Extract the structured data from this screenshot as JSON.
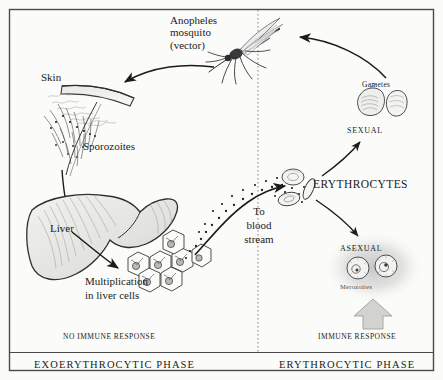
{
  "figure": {
    "title_semantic": "malaria-life-cycle-diagram",
    "frame_color": "#4a4a4a",
    "ink_color": "#1b1b1b",
    "halo_color": "#c9c9c9",
    "arrow_block_color": "#cfcfcf",
    "divider_style": "dotted"
  },
  "labels": {
    "mosquito": "Anopheles\nmosquito\n(vector)",
    "skin": "Skin",
    "sporozoites": "Sporozoites",
    "liver": "Liver",
    "multiplication": "Multiplication\nin liver cells",
    "to_blood_stream": "To\nblood\nstream",
    "erythrocytes": "ERYTHROCYTES",
    "gametes": "Gametes",
    "sexual": "SEXUAL",
    "asexual": "ASEXUAL",
    "merozoites": "Merozoites",
    "no_immune_response": "NO IMMUNE RESPONSE",
    "immune_response": "IMMUNE RESPONSE",
    "exoerythrocytic_phase": "EXOERYTHROCYTIC PHASE",
    "erythrocytic_phase": "ERYTHROCYTIC PHASE"
  }
}
